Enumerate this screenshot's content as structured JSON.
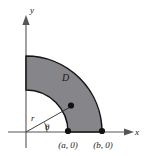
{
  "figure": {
    "background_color": "#ffffff",
    "region_fill_color": "#85858a",
    "outline_color": "#131313",
    "axis_color": "#55555a"
  },
  "axes": {
    "x_label": "x",
    "y_label": "y",
    "origin": {
      "x": 26,
      "y": 132
    }
  },
  "region": {
    "label": "D",
    "inner_radius": 42,
    "outer_radius": 76,
    "start_angle_deg": 0,
    "end_angle_deg": 90
  },
  "annotations": {
    "radius_label": "r",
    "angle_label": "θ"
  },
  "points": [
    {
      "label": "(a, 0)",
      "x": 68,
      "y": 131
    },
    {
      "label": "(b, 0)",
      "x": 102,
      "y": 131
    }
  ],
  "interior_point": {
    "x": 71,
    "y": 106
  }
}
